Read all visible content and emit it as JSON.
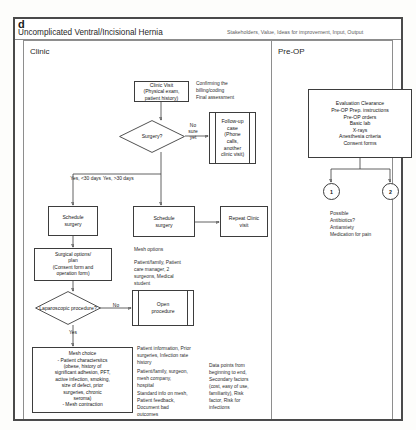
{
  "figure": {
    "panel_letter": "d",
    "title": "Uncomplicated Ventral/Incisional Hernia",
    "legend": "Stakeholders, Value, Ideas for improvement, Input, Output"
  },
  "lanes": [
    {
      "label": "Clinic"
    },
    {
      "label": "Pre-OP"
    }
  ],
  "clinic": {
    "clinic_visit": "Clinic Visit\n(Physical exam,\npatient history)",
    "clinic_visit_note": "Confirming the\nbilling/coding\nFinal assessment",
    "surgery_decision": "Surgery?",
    "no_sure_yet_label": "No\nsure\nyet",
    "followup_case": "Follow-up\ncase\n(Phone\ncalls,\nanother\nclinic visit)",
    "yes_lt30_label": "Yes, <30 days",
    "yes_gt30_label": "Yes, >30 days",
    "schedule_surgery_left": "Schedule\nsurgery",
    "schedule_surgery_right": "Schedule\nsurgery",
    "repeat_clinic_visit": "Repeat Clinic\nvisit",
    "surgical_options": "Surgical options/\nplan\n(Consent form and\noperation form)",
    "mesh_options_heading": "Mesh options",
    "mesh_options_stakeholders": "Patient/family, Patient\ncare manager,  2\nsurgeons, Medical\nstudent",
    "laparoscopic_decision": "Laparoscopic\nprocedure?",
    "lap_no_label": "No",
    "open_procedure": "Open\nprocedure",
    "lap_yes_label": "Yes",
    "mesh_choice": "Mesh choice\n- Patient charactersitcs\n(obese, history of\nsignificant adhesion, PFT,\nactive infection, smoking,\nsize of defect, prior\nsurgeries, chronic\nseroma)\n- Mesh contraction",
    "anno_input_output": "Patient information, Prior\nsurgeries, Infection rate\nhistory",
    "anno_stakeholders2": "Patient/family, surgeon,\nmesh company,\nhospital",
    "anno_ideas": "Standard info on mesh,\nPatient feedback,\nDocument bad\noutcomes",
    "anno_datapoints": "Data points from\nbeginning to end,\nSecondary factors\n(cost, easy of use,\nfamiliarity), Risk\nfactor, Risk for\ninfections"
  },
  "preop": {
    "evaluation_box": "Evaluation Clearance\nPre-OP Prep. instructions\nPre-OP orders\nBasic lab\nX-rays\nAnesthesia criteria\nConsent forms",
    "circle_one": "1",
    "circle_two": "2",
    "medication_note": "Possible\nAntibiotics?\nAntianxiety\nMedication for pain"
  },
  "colors": {
    "frame": "#4a4a4a",
    "lane_border": "#8e8e8e",
    "node_border": "#3d3d3d",
    "wire": "#3a3a3a",
    "text": "#161616",
    "anno_text": "#2c2c2c"
  }
}
